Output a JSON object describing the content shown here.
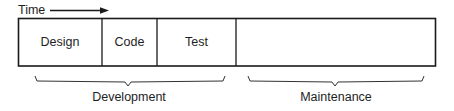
{
  "diagram": {
    "time_label": "Time",
    "arrow": {
      "direction": "right",
      "meaning": "time progression"
    },
    "phases": [
      {
        "id": "design",
        "label": "Design",
        "x": 18,
        "width": 84
      },
      {
        "id": "code",
        "label": "Code",
        "x": 102,
        "width": 55
      },
      {
        "id": "test",
        "label": "Test",
        "x": 157,
        "width": 79
      },
      {
        "id": "maintenance-block",
        "label": "",
        "x": 236,
        "width": 200
      }
    ],
    "groups": [
      {
        "id": "development",
        "label": "Development",
        "spans": [
          "Design",
          "Code",
          "Test"
        ],
        "center_x": 129
      },
      {
        "id": "maintenance",
        "label": "Maintenance",
        "spans": [
          "(unlabeled block)"
        ],
        "center_x": 336
      }
    ],
    "colors": {
      "stroke": "#1a1a1a",
      "background": "#ffffff",
      "text": "#1e1e1e"
    }
  }
}
